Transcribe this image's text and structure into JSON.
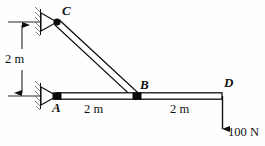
{
  "figure": {
    "background_color": "#fefefe",
    "line_color": "#111111",
    "nodes": [
      {
        "id": "C",
        "label": "C",
        "x": 57,
        "y": 22,
        "support": "pin"
      },
      {
        "id": "A",
        "label": "A",
        "x": 57,
        "y": 96,
        "support": "pin"
      },
      {
        "id": "B",
        "label": "B",
        "x": 137,
        "y": 96,
        "support": "none"
      },
      {
        "id": "D",
        "label": "D",
        "x": 222,
        "y": 96,
        "support": "none"
      }
    ],
    "members": [
      {
        "id": "CB",
        "from": "C",
        "to": "B",
        "style": "double-line"
      },
      {
        "id": "AD",
        "from": "A",
        "to": "D",
        "style": "double-line"
      }
    ],
    "dimensions": [
      {
        "id": "vertical-A-C",
        "label": "2 m",
        "orientation": "vertical"
      },
      {
        "id": "horizontal-A-B",
        "label": "2 m",
        "orientation": "horizontal"
      },
      {
        "id": "horizontal-B-D",
        "label": "2 m",
        "orientation": "horizontal"
      }
    ],
    "loads": [
      {
        "id": "load-D",
        "label": "100 N",
        "magnitude": 100,
        "unit": "N",
        "direction": "down",
        "applied_at": "D"
      }
    ]
  }
}
